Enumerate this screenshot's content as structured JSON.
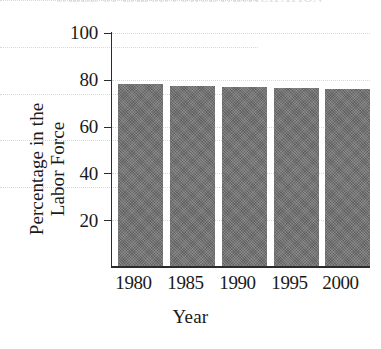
{
  "figure": {
    "cropped_title_remnant": "TABLE OF LABOR FORCE PARTICIPATION",
    "background_color": "#ffffff",
    "bar_color": "#6e6e6e",
    "axis_color": "#2b2b2b",
    "gridline_color": "#d8d8d8"
  },
  "chart_data": {
    "type": "bar",
    "title": "",
    "xlabel": "Year",
    "ylabel": "Percentage in the Labor Force",
    "ylabel_lines": [
      "Percentage in the",
      "Labor Force"
    ],
    "categories": [
      "1980",
      "1985",
      "1990",
      "1995",
      "2000"
    ],
    "values": [
      78,
      77.5,
      77,
      76.5,
      76
    ],
    "ylim": [
      0,
      100
    ],
    "yticks": [
      20,
      40,
      60,
      80,
      100
    ],
    "ytick_labels": [
      "20",
      "40",
      "60",
      "80",
      "100"
    ],
    "xtick_labels": [
      "1980",
      "1985",
      "1990",
      "1995",
      "2000"
    ],
    "grid": true,
    "grid_axis": "y",
    "grid_style": "dotted",
    "legend": false,
    "legend_position": "none",
    "series": [
      {
        "name": "Percentage in the Labor Force",
        "values": [
          78,
          77.5,
          77,
          76.5,
          76
        ]
      }
    ]
  }
}
